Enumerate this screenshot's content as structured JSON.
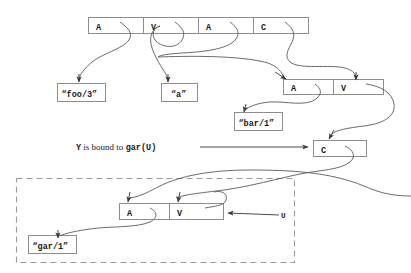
{
  "figure": {
    "caption_text": {
      "var": "Y",
      "middle": " is bound to ",
      "term": "gar(U)"
    },
    "colors": {
      "box_stroke": "#8d8d8d",
      "dashed_stroke": "#9a9a9a",
      "arrow": "#4a4a4a",
      "text": "#1a1a1a",
      "background": "#ffffff"
    }
  },
  "structures": {
    "top_row": {
      "name": "top-term-cells",
      "cells": [
        {
          "tag": "A"
        },
        {
          "tag": "V"
        },
        {
          "tag": "A"
        },
        {
          "tag": "C"
        }
      ]
    },
    "second_row": {
      "name": "second-term-cells",
      "cells": [
        {
          "tag": "A"
        },
        {
          "tag": "V"
        }
      ]
    },
    "third_row": {
      "name": "third-term-cell",
      "cells": [
        {
          "tag": "C"
        }
      ]
    },
    "dashed_row": {
      "name": "dashed-term-cells",
      "cells": [
        {
          "tag": "A"
        },
        {
          "tag": "V"
        }
      ]
    }
  },
  "atoms": [
    {
      "name": "atom-foo",
      "label": "“foo/3”"
    },
    {
      "name": "atom-a",
      "label": "“a”"
    },
    {
      "name": "atom-bar",
      "label": "“bar/1”"
    },
    {
      "name": "atom-gar",
      "label": "“gar/1”"
    }
  ],
  "labels": {
    "u_variable": "U"
  }
}
